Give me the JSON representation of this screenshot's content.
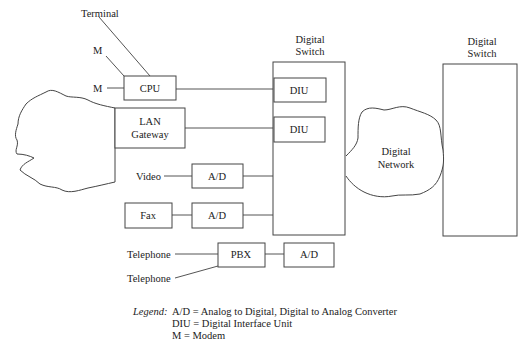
{
  "labels": {
    "terminal": "Terminal",
    "modem_top": "M",
    "modem_left": "M",
    "video": "Video",
    "telephone_1": "Telephone",
    "telephone_2": "Telephone"
  },
  "nodes": {
    "cpu": "CPU",
    "lan_gateway_line1": "LAN",
    "lan_gateway_line2": "Gateway",
    "fax": "Fax",
    "ad_video": "A/D",
    "ad_fax": "A/D",
    "pbx": "PBX",
    "ad_pbx": "A/D",
    "diu_1": "DIU",
    "diu_2": "DIU",
    "switch_left_line1": "Digital",
    "switch_left_line2": "Switch",
    "switch_right_line1": "Digital",
    "switch_right_line2": "Switch",
    "network_line1": "Digital",
    "network_line2": "Network"
  },
  "legend": {
    "title": "Legend:",
    "entries": [
      "A/D = Analog to Digital, Digital to Analog Converter",
      "DIU = Digital Interface Unit",
      "M = Modem"
    ]
  }
}
